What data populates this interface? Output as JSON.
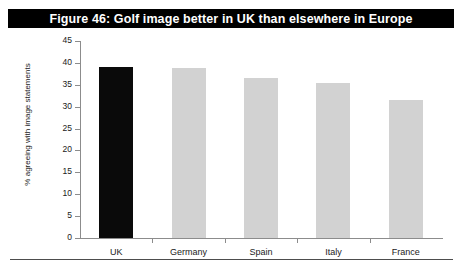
{
  "figure": {
    "title": "Figure 46: Golf image better in UK than elsewhere in Europe",
    "title_background": "#000000",
    "title_color": "#ffffff"
  },
  "chart_data": {
    "type": "bar",
    "title": "Figure 46: Golf image better in UK than elsewhere in Europe",
    "categories": [
      "UK",
      "Germany",
      "Spain",
      "Italy",
      "France"
    ],
    "values": [
      39,
      38.8,
      36.5,
      35.5,
      31.5
    ],
    "xlabel": "",
    "ylabel": "% agreeing with image statements",
    "ylim": [
      0,
      45
    ],
    "yticks": [
      0,
      5,
      10,
      15,
      20,
      25,
      30,
      35,
      40,
      45
    ],
    "ytick_labels": [
      "0",
      "5",
      "10",
      "15",
      "20",
      "25",
      "30",
      "35",
      "40",
      "45"
    ],
    "grid": false,
    "legend": "none",
    "bar_colors": [
      "#0a0a0a",
      "#d2d2d2",
      "#d2d2d2",
      "#d2d2d2",
      "#d2d2d2"
    ],
    "highlight_category": "UK",
    "axis_color": "#8c8c8c"
  }
}
